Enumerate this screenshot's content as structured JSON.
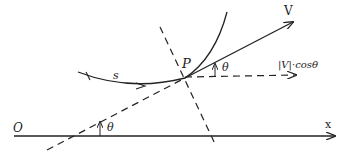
{
  "diagram": {
    "labels": {
      "origin": "O",
      "x_axis": "x",
      "velocity": "V",
      "point": "P",
      "arc_length": "s",
      "angle_at_p": "θ",
      "angle_at_axis": "θ",
      "projection": "|V|·cosθ"
    },
    "colors": {
      "stroke": "#222222",
      "background": "#ffffff"
    }
  }
}
